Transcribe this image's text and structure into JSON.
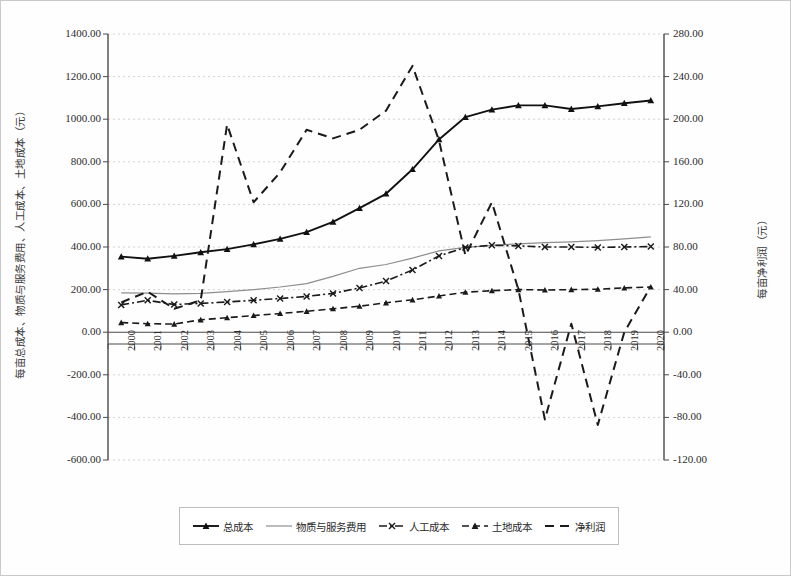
{
  "axes": {
    "y_left_title": "每亩总成本、物质与服务费用、人工成本、土地成本（元）",
    "y_right_title": "每亩净利润（元）",
    "y_left_ticks": [
      "1400.00",
      "1200.00",
      "1000.00",
      "800.00",
      "600.00",
      "400.00",
      "200.00",
      "0.00",
      "-200.00",
      "-400.00",
      "-600.00"
    ],
    "y_right_ticks": [
      "280.00",
      "240.00",
      "200.00",
      "160.00",
      "120.00",
      "80.00",
      "40.00",
      "0.00",
      "-40.00",
      "-80.00",
      "-120.00"
    ]
  },
  "legend": {
    "items": [
      {
        "label": "总成本",
        "marker": "triangle",
        "style": "solid",
        "color": "#1a1a1a"
      },
      {
        "label": "物质与服务费用",
        "marker": "none",
        "style": "solid",
        "color": "#8a8a8a"
      },
      {
        "label": "人工成本",
        "marker": "x",
        "style": "dashdot",
        "color": "#1a1a1a"
      },
      {
        "label": "土地成本",
        "marker": "triangle",
        "style": "dashed",
        "color": "#1a1a1a"
      },
      {
        "label": "净利润",
        "marker": "none",
        "style": "dashed-long",
        "color": "#1a1a1a"
      }
    ]
  },
  "chart_data": {
    "type": "line",
    "title": "",
    "xlabel": "",
    "ylabel": "每亩总成本、物质与服务费用、人工成本、土地成本（元）",
    "y2label": "每亩净利润（元）",
    "grid": true,
    "legend_position": "bottom",
    "ylim": [
      -600,
      1400
    ],
    "y2lim": [
      -120,
      280
    ],
    "categories": [
      "2000",
      "2001",
      "2002",
      "2003",
      "2004",
      "2005",
      "2006",
      "2007",
      "2008",
      "2009",
      "2010",
      "2011",
      "2012",
      "2013",
      "2014",
      "2015",
      "2016",
      "2017",
      "2018",
      "2019",
      "2020"
    ],
    "series": [
      {
        "name": "总成本",
        "axis": "left",
        "values": [
          355,
          345,
          358,
          375,
          390,
          412,
          438,
          470,
          518,
          582,
          650,
          765,
          905,
          1010,
          1045,
          1065,
          1065,
          1048,
          1060,
          1075,
          1088
        ]
      },
      {
        "name": "物质与服务费用",
        "axis": "left",
        "values": [
          185,
          183,
          180,
          182,
          190,
          200,
          212,
          228,
          262,
          300,
          318,
          348,
          382,
          398,
          408,
          415,
          420,
          424,
          430,
          438,
          448
        ]
      },
      {
        "name": "人工成本",
        "axis": "left",
        "values": [
          128,
          150,
          130,
          135,
          142,
          150,
          158,
          168,
          182,
          208,
          240,
          292,
          358,
          398,
          408,
          405,
          400,
          400,
          398,
          400,
          402
        ]
      },
      {
        "name": "土地成本",
        "axis": "left",
        "values": [
          45,
          40,
          38,
          58,
          68,
          78,
          88,
          98,
          110,
          122,
          138,
          152,
          170,
          188,
          195,
          200,
          198,
          200,
          202,
          208,
          212
        ]
      },
      {
        "name": "净利润",
        "axis": "right",
        "values": [
          28,
          38,
          22,
          30,
          195,
          122,
          150,
          190,
          182,
          190,
          208,
          250,
          180,
          72,
          122,
          40,
          -82,
          8,
          -87,
          0,
          43
        ]
      }
    ]
  }
}
